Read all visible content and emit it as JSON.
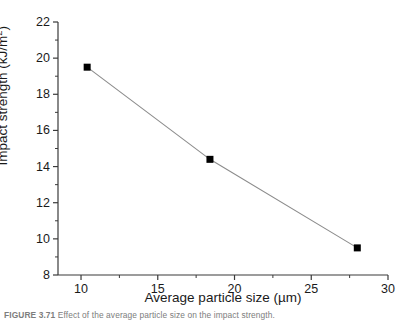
{
  "figure": {
    "caption_label": "FIGURE 3.71",
    "caption_text": "Effect of the average particle size on the impact strength.",
    "background_color": "#ffffff",
    "axis_color": "#3a3a3a",
    "line_color": "#8c8c8c",
    "marker_color": "#000000"
  },
  "chart_data": {
    "type": "line",
    "title": "",
    "subtitle": "",
    "xlabel": "Average particle size (µm)",
    "ylabel": "Impact strength (kJ/m²)",
    "xlabel_parts": {
      "text": "Average particle size (",
      "unit": "µm",
      "close": ")"
    },
    "ylabel_parts": {
      "text": "Impact strength (kJ/m",
      "sup": "2",
      "close": ")"
    },
    "xlim": [
      8.5,
      30
    ],
    "ylim": [
      8,
      22
    ],
    "grid": false,
    "legend": null,
    "legend_position": "none",
    "x_major_ticks": [
      10,
      15,
      20,
      25,
      30
    ],
    "x_major_tick_labels": [
      "10",
      "15",
      "20",
      "25",
      "30"
    ],
    "x_minor_ticks": [
      12.5,
      17.5,
      22.5,
      27.5
    ],
    "y_major_ticks": [
      8,
      10,
      12,
      14,
      16,
      18,
      20,
      22
    ],
    "y_major_tick_labels": [
      "8",
      "10",
      "12",
      "14",
      "16",
      "18",
      "20",
      "22"
    ],
    "y_minor_ticks": [
      9,
      11,
      13,
      15,
      17,
      19,
      21
    ],
    "series": [
      {
        "name": "Impact strength",
        "marker": "square",
        "marker_size": 7,
        "x": [
          10.4,
          18.4,
          28.0
        ],
        "values": [
          19.5,
          14.4,
          9.5
        ]
      }
    ],
    "points": [
      {
        "x": 10.4,
        "y": 19.5
      },
      {
        "x": 18.4,
        "y": 14.4
      },
      {
        "x": 28.0,
        "y": 9.5
      }
    ]
  }
}
